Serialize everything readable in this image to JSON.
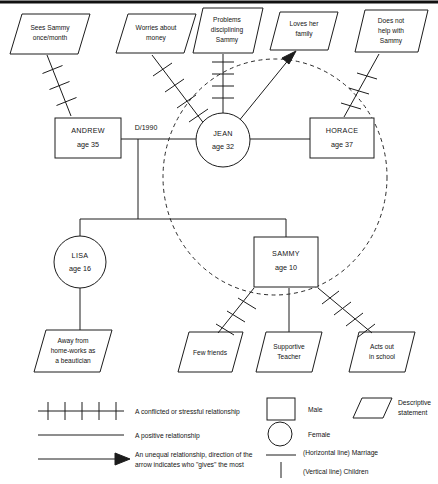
{
  "people": [
    {
      "id": "andrew",
      "name": "ANDREW",
      "age_label": "age 35",
      "shape": "square",
      "gender": "Male"
    },
    {
      "id": "jean",
      "name": "JEAN",
      "age_label": "age 32",
      "shape": "circle",
      "gender": "Female"
    },
    {
      "id": "horace",
      "name": "HORACE",
      "age_label": "age 37",
      "shape": "square",
      "gender": "Male"
    },
    {
      "id": "lisa",
      "name": "LISA",
      "age_label": "age 16",
      "shape": "circle",
      "gender": "Female"
    },
    {
      "id": "sammy",
      "name": "SAMMY",
      "age_label": "age 10",
      "shape": "square",
      "gender": "Male"
    }
  ],
  "marriage_labels": {
    "andrew_jean": "D/1990"
  },
  "statements_top": [
    {
      "id": "sees-sammy",
      "line1": "Sees Sammy",
      "line2": "once/month",
      "line3": "",
      "relation": "conflicted",
      "attached_to": "andrew"
    },
    {
      "id": "worries-money",
      "line1": "Worries about",
      "line2": "money",
      "line3": "",
      "relation": "conflicted",
      "attached_to": "jean"
    },
    {
      "id": "problems-disc",
      "line1": "Problems",
      "line2": "disciplining",
      "line3": "Sammy",
      "relation": "conflicted",
      "attached_to": "jean"
    },
    {
      "id": "loves-family",
      "line1": "Loves her",
      "line2": "family",
      "line3": "",
      "relation": "unequal",
      "attached_to": "jean"
    },
    {
      "id": "does-not-help",
      "line1": "Does not",
      "line2": "help with",
      "line3": "Sammy",
      "relation": "conflicted",
      "attached_to": "horace"
    }
  ],
  "statements_bottom": [
    {
      "id": "away-from-home",
      "line1": "Away from",
      "line2": "home-works as",
      "line3": "a beautician",
      "relation": "positive",
      "attached_to": "lisa"
    },
    {
      "id": "few-friends",
      "line1": "Few friends",
      "line2": "",
      "line3": "",
      "relation": "conflicted",
      "attached_to": "sammy"
    },
    {
      "id": "supportive-teacher",
      "line1": "Supportive",
      "line2": "Teacher",
      "line3": "",
      "relation": "positive",
      "attached_to": "sammy"
    },
    {
      "id": "acts-out",
      "line1": "Acts out",
      "line2": "in school",
      "line3": "",
      "relation": "conflicted",
      "attached_to": "sammy"
    }
  ],
  "legend_left": [
    {
      "id": "conflicted",
      "symbol": "hatched-line",
      "text": "A conflicted or stressful relationship"
    },
    {
      "id": "positive",
      "symbol": "plain-line",
      "text": "A positive relationship"
    },
    {
      "id": "unequal",
      "symbol": "arrow-line",
      "text_line1": "An unequal relationship, direction of the",
      "text_line2": "arrow indicates who \"gives\" the most"
    }
  ],
  "legend_right": [
    {
      "id": "male",
      "symbol": "square",
      "text": "Male"
    },
    {
      "id": "female",
      "symbol": "circle",
      "text": "Female"
    },
    {
      "id": "marriage",
      "symbol": "horizontal-line",
      "text": "(Horizontal line) Marriage"
    },
    {
      "id": "children",
      "symbol": "vertical-line",
      "text": "(Vertical line) Children"
    }
  ],
  "legend_right_extra": [
    {
      "id": "descriptive",
      "symbol": "parallelogram",
      "text_line1": "Descriptive",
      "text_line2": "statement"
    }
  ],
  "colors": {
    "ink": "#1c1c1c",
    "background": "#ffffff",
    "dashed": "#2a2a2a"
  }
}
